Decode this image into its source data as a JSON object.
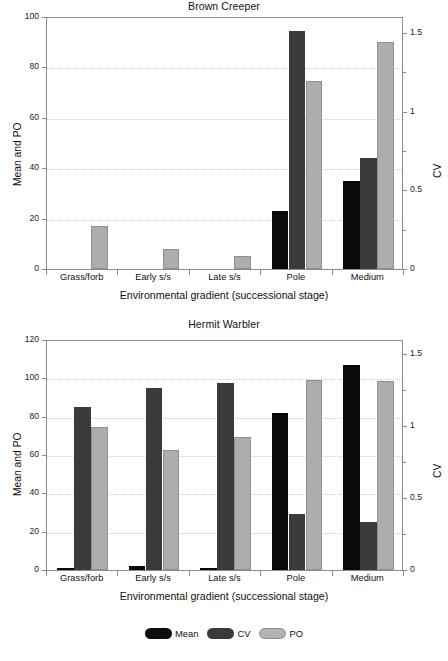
{
  "figure": {
    "legend": [
      {
        "key": "mean",
        "label": "Mean",
        "color": "#0d0d0d"
      },
      {
        "key": "cv",
        "label": "CV",
        "color": "#3b3b3b"
      },
      {
        "key": "po",
        "label": "PO",
        "color": "#b3b3b3"
      }
    ]
  },
  "chart_data": [
    {
      "type": "bar",
      "panel_letter": "A",
      "title": "Brown Creeper",
      "xlabel": "Environmental gradient (successional stage)",
      "ylabel": "Mean and PO",
      "ylabel_right": "CV",
      "categories": [
        "Grass/forb",
        "Early s/s",
        "Late s/s",
        "Pole",
        "Medium"
      ],
      "ylim": [
        0,
        100
      ],
      "yticks": [
        0,
        20,
        40,
        60,
        80,
        100
      ],
      "yticklabels": [
        "0",
        "20",
        "40",
        "60",
        "80",
        "100"
      ],
      "ylim_right": [
        0,
        1.6
      ],
      "yticks_right": [
        0,
        0.5,
        1,
        1.5
      ],
      "yticklabels_right": [
        "0",
        "0.5",
        "1",
        "1.5"
      ],
      "yticks_right_minor": [
        0.25,
        0.75,
        1.25
      ],
      "grid": true,
      "legend_position": "below-figure",
      "series": [
        {
          "name": "Mean",
          "axis": "left",
          "values": [
            0,
            0,
            0,
            23,
            35
          ]
        },
        {
          "name": "CV",
          "axis": "right",
          "values": [
            0,
            0,
            0,
            1.51,
            0.7
          ]
        },
        {
          "name": "PO",
          "axis": "left",
          "values": [
            17,
            8,
            5,
            74.5,
            90
          ]
        }
      ],
      "series_left_equivalent": {
        "Mean": [
          0,
          0,
          0,
          23,
          35
        ],
        "CV_as_left": [
          0,
          0,
          0,
          94.5,
          44
        ],
        "PO": [
          17,
          8,
          5,
          74.5,
          90
        ]
      }
    },
    {
      "type": "bar",
      "panel_letter": "B",
      "title": "Hermit Warbler",
      "xlabel": "Environmental gradient (successional stage)",
      "ylabel": "Mean and PO",
      "ylabel_right": "CV",
      "categories": [
        "Grass/forb",
        "Early s/s",
        "Late s/s",
        "Pole",
        "Medium"
      ],
      "ylim": [
        0,
        120
      ],
      "yticks": [
        0,
        20,
        40,
        60,
        80,
        100,
        120
      ],
      "yticklabels": [
        "0",
        "20",
        "40",
        "60",
        "80",
        "100",
        "120"
      ],
      "ylim_right": [
        0,
        1.6
      ],
      "yticks_right": [
        0,
        0.5,
        1,
        1.5
      ],
      "yticklabels_right": [
        "0",
        "0.5",
        "1",
        "1.5"
      ],
      "yticks_right_minor": [
        0.25,
        0.75,
        1.25
      ],
      "grid": true,
      "legend_position": "below-figure",
      "series": [
        {
          "name": "Mean",
          "axis": "left",
          "values": [
            1,
            2,
            1,
            82,
            107
          ]
        },
        {
          "name": "CV",
          "axis": "right",
          "values": [
            1.13,
            1.27,
            1.3,
            0.39,
            0.33
          ]
        },
        {
          "name": "PO",
          "axis": "left",
          "values": [
            74.5,
            62.5,
            69.5,
            99,
            98.5
          ]
        }
      ],
      "series_left_equivalent": {
        "Mean": [
          1,
          2,
          1,
          82,
          107
        ],
        "CV_as_left": [
          85,
          95,
          97.5,
          29,
          25
        ],
        "PO": [
          74.5,
          62.5,
          69.5,
          99,
          98.5
        ]
      }
    }
  ]
}
